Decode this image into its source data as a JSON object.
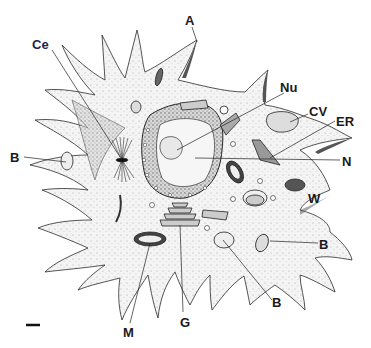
{
  "diagram": {
    "colors": {
      "ink": "#1a1a1a",
      "cell_fill": "#f2f2f2",
      "stipple": "#8a8a8a",
      "label_ce": "#1c2452"
    },
    "labels": [
      {
        "id": "A",
        "text": "A",
        "x": 185,
        "y": 14
      },
      {
        "id": "Ce",
        "text": "Ce",
        "x": 32,
        "y": 38
      },
      {
        "id": "Nu",
        "text": "Nu",
        "x": 280,
        "y": 81
      },
      {
        "id": "CV",
        "text": "CV",
        "x": 309,
        "y": 105
      },
      {
        "id": "ER",
        "text": "ER",
        "x": 336,
        "y": 115
      },
      {
        "id": "N",
        "text": "N",
        "x": 342,
        "y": 155
      },
      {
        "id": "B_left",
        "text": "B",
        "x": 10,
        "y": 151
      },
      {
        "id": "W",
        "text": "W",
        "x": 308,
        "y": 192
      },
      {
        "id": "B_right",
        "text": "B",
        "x": 319,
        "y": 238
      },
      {
        "id": "B_bottom",
        "text": "B",
        "x": 272,
        "y": 296
      },
      {
        "id": "M",
        "text": "M",
        "x": 123,
        "y": 326
      },
      {
        "id": "G",
        "text": "G",
        "x": 180,
        "y": 316
      }
    ],
    "legend": {
      "A": "Arm / pseudopod",
      "Ce": "Centrosome (spindle)",
      "Nu": "Nucleolus",
      "CV": "Contractile vacuole",
      "ER": "Endoplasmic reticulum",
      "N": "Nucleus",
      "B": "Bacterium / food vacuole",
      "W": "Vesicle",
      "M": "Mitochondrion",
      "G": "Golgi apparatus"
    },
    "scale_bar": {
      "x1": 26,
      "x2": 40,
      "y": 325
    }
  }
}
